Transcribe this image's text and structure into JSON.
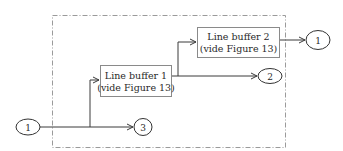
{
  "diagram": {
    "type": "block-diagram",
    "boundary": {
      "style": "dash-dot"
    },
    "blocks": [
      {
        "id": "lb1",
        "line1": "Line buffer 1",
        "line2": "(vide Figure 13)"
      },
      {
        "id": "lb2",
        "line1": "Line buffer 2",
        "line2": "(vide Figure 13)"
      }
    ],
    "nodes": [
      {
        "id": "in1",
        "label": "1",
        "role": "input"
      },
      {
        "id": "out3",
        "label": "3",
        "role": "output"
      },
      {
        "id": "out2",
        "label": "2",
        "role": "output"
      },
      {
        "id": "out1",
        "label": "1",
        "role": "output"
      }
    ],
    "edges": [
      {
        "from": "in1",
        "to": "out3"
      },
      {
        "from": "in1",
        "to": "lb1"
      },
      {
        "from": "lb1",
        "to": "out2"
      },
      {
        "from": "lb1",
        "to": "lb2"
      },
      {
        "from": "lb2",
        "to": "out1"
      }
    ]
  }
}
